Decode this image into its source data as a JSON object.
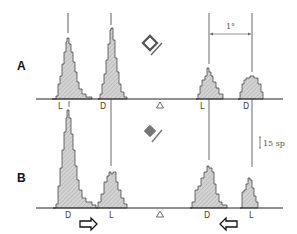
{
  "figure": {
    "panels": [
      {
        "id": "A",
        "label": "A",
        "axis_labels": [
          "L",
          "D",
          "L",
          "D"
        ],
        "center_marker": "triangle-icon",
        "stimulus_icon": "open-diamond-icon",
        "angle_annotation": "1°"
      },
      {
        "id": "B",
        "label": "B",
        "axis_labels": [
          "D",
          "L",
          "D",
          "L"
        ],
        "center_marker": "triangle-icon",
        "stimulus_icon": "filled-diamond-icon",
        "scale_annotation": "15 sp",
        "arrows": [
          "right-arrow-icon",
          "left-arrow-icon"
        ]
      }
    ],
    "colors": {
      "histogram_fill": "#c8c8c8",
      "line": "#222222",
      "reference_line": "#555555"
    }
  }
}
